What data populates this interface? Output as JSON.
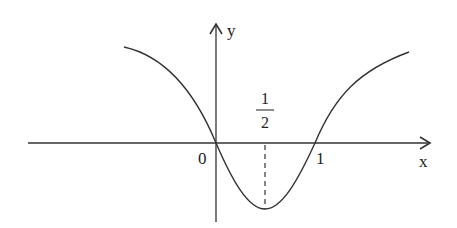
{
  "diagram": {
    "type": "function-graph",
    "axes": {
      "x_label": "x",
      "y_label": "y",
      "origin_label": "0"
    },
    "ticks": [
      {
        "value": 0,
        "label": "0"
      },
      {
        "value": 0.5,
        "label_num": "1",
        "label_den": "2"
      },
      {
        "value": 1,
        "label": "1"
      }
    ],
    "features": {
      "zeros": [
        0,
        1
      ],
      "minimum_x": "1/2",
      "dashed_guide_at_x": "1/2"
    },
    "colors": {
      "curve": "#333333",
      "axes": "#333333",
      "background": "#ffffff"
    }
  }
}
